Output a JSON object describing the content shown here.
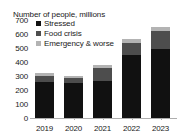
{
  "chart_data": {
    "type": "bar",
    "subtype": "stacked-vertical",
    "title": "Number of people, millions",
    "xlabel": "",
    "ylabel": "",
    "categories": [
      "2019",
      "2020",
      "2021",
      "2022",
      "2023"
    ],
    "series": [
      {
        "name": "Stressed",
        "color": "#111111",
        "values": [
          257,
          247,
          267,
          452,
          492
        ]
      },
      {
        "name": "Food crisis",
        "color": "#4d4d4d",
        "values": [
          45,
          40,
          90,
          85,
          130
        ]
      },
      {
        "name": "Emergency & worse",
        "color": "#b3b3b3",
        "values": [
          18,
          13,
          25,
          25,
          25
        ]
      }
    ],
    "totals": [
      320,
      300,
      382,
      562,
      647
    ],
    "ylim": [
      0,
      700
    ],
    "yticks": [
      0,
      100,
      200,
      300,
      400,
      500,
      600,
      700
    ],
    "ytick_labels": [
      "0",
      "100",
      "200",
      "300",
      "400",
      "500",
      "600",
      "700"
    ],
    "grid": false,
    "legend_position": "top-left",
    "legend": [
      "Stressed",
      "Food crisis",
      "Emergency & worse"
    ],
    "axis_color": "#aeaeae",
    "background": "#ffffff",
    "text_color": "#1a1a1a"
  }
}
